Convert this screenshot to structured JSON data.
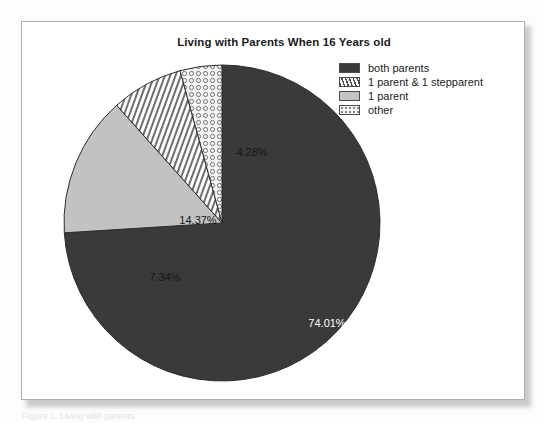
{
  "chart_title": "Living with Parents When 16 Years old",
  "caption_sliver": "Figure 1. Living with parents",
  "legend": {
    "items": [
      {
        "label": "both parents",
        "pattern": "solid-dark",
        "color": "#3a3a3a"
      },
      {
        "label": "1 parent & 1 stepparent",
        "pattern": "hatch",
        "color": "#ffffff"
      },
      {
        "label": "1 parent",
        "pattern": "solid-light",
        "color": "#c2c2c2"
      },
      {
        "label": "other",
        "pattern": "dots",
        "color": "#f2f2f2"
      }
    ]
  },
  "chart_data": {
    "type": "pie",
    "title": "Living with Parents When 16 Years old",
    "xlabel": "",
    "ylabel": "",
    "start_angle_deg": 0,
    "direction": "clockwise",
    "legend_position": "top-right",
    "grid": false,
    "categories": [
      "both parents",
      "1 parent",
      "1 parent & 1 stepparent",
      "other"
    ],
    "values": [
      74.01,
      14.37,
      7.34,
      4.28
    ],
    "labels": [
      "74.01%",
      "14.37%",
      "7.34%",
      "4.28%"
    ],
    "slices": [
      {
        "name": "both parents",
        "value": 74.01,
        "label": "74.01%",
        "pattern": "solid-dark",
        "color": "#3a3a3a",
        "label_color": "#ffffff",
        "label_x": 265,
        "label_y": 264
      },
      {
        "name": "1 parent",
        "value": 14.37,
        "label": "14.37%",
        "pattern": "solid-light",
        "color": "#c2c2c2",
        "label_color": "#161616",
        "label_x": 136,
        "label_y": 161
      },
      {
        "name": "1 parent & 1 stepparent",
        "value": 7.34,
        "label": "7.34%",
        "pattern": "hatch",
        "color": "#ffffff",
        "label_color": "#161616",
        "label_x": 103,
        "label_y": 218
      },
      {
        "name": "other",
        "value": 4.28,
        "label": "4.28%",
        "pattern": "dots",
        "color": "#f2f2f2",
        "label_color": "#161616",
        "label_x": 190,
        "label_y": 93
      }
    ]
  }
}
